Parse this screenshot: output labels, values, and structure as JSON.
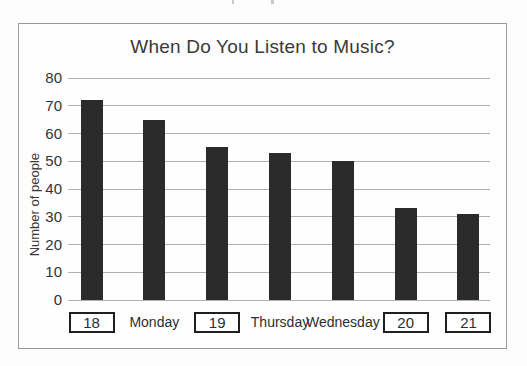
{
  "chart_data": {
    "type": "bar",
    "title": "When Do You Listen to Music?",
    "ylabel": "Number of people",
    "xlabel": "",
    "categories": [
      "18",
      "Monday",
      "19",
      "Thursday",
      "Wednesday",
      "20",
      "21"
    ],
    "boxed_categories": [
      true,
      false,
      true,
      false,
      false,
      true,
      true
    ],
    "values": [
      72,
      65,
      55,
      53,
      50,
      33,
      31
    ],
    "yticks": [
      0,
      10,
      20,
      30,
      40,
      50,
      60,
      70,
      80
    ],
    "ylim": [
      0,
      80
    ],
    "grid": true,
    "legend_position": "none",
    "bar_color": "#2b2b2b",
    "grid_color": "#b0b0b0",
    "frame_color": "#9b9b9b",
    "text_color": "#3a3a3a"
  }
}
